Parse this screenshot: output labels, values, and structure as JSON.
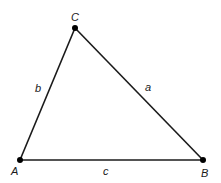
{
  "diagram": {
    "type": "triangle",
    "stroke_color": "#1a1a1a",
    "background": "#ffffff",
    "vertices": [
      {
        "name": "A",
        "x": 20,
        "y": 160,
        "label": "A",
        "label_x": 11,
        "label_y": 175
      },
      {
        "name": "B",
        "x": 203,
        "y": 160,
        "label": "B",
        "label_x": 201,
        "label_y": 177
      },
      {
        "name": "C",
        "x": 75,
        "y": 28,
        "label": "C",
        "label_x": 71,
        "label_y": 21
      }
    ],
    "sides": [
      {
        "name": "a",
        "from": "B",
        "to": "C",
        "label": "a",
        "label_x": 145,
        "label_y": 91
      },
      {
        "name": "b",
        "from": "A",
        "to": "C",
        "label": "b",
        "label_x": 35,
        "label_y": 92
      },
      {
        "name": "c",
        "from": "A",
        "to": "B",
        "label": "c",
        "label_x": 103,
        "label_y": 175
      }
    ]
  }
}
